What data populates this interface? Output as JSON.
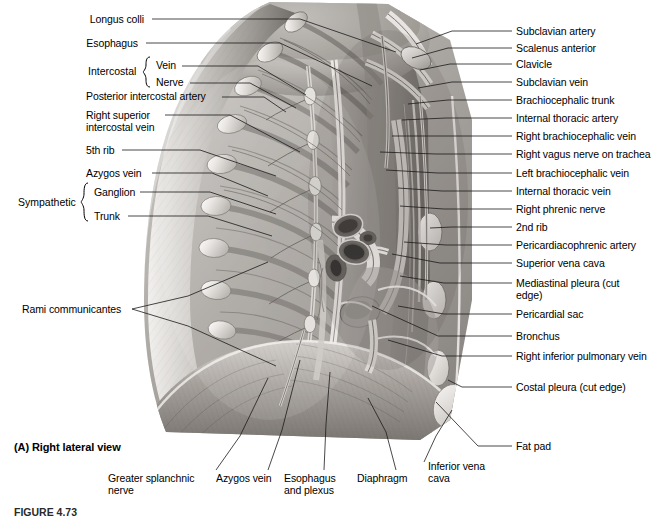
{
  "figure": {
    "view_caption": "(A) Right lateral view",
    "figure_number": "FIGURE 4.73",
    "illustration_alt": "Right lateral view of the thoracic cavity wall and mediastinum, grayscale anatomical drawing"
  },
  "labels_left": [
    {
      "id": "longus-colli",
      "text": "Longus colli",
      "x": 88,
      "y": 13
    },
    {
      "id": "esophagus",
      "text": "Esophagus",
      "x": 88,
      "y": 37
    },
    {
      "id": "intercostal-vein",
      "text": "Vein",
      "x": 152,
      "y": 62
    },
    {
      "id": "intercostal-nerve",
      "text": "Nerve",
      "x": 152,
      "y": 79
    },
    {
      "id": "posterior-intercostal-artery",
      "text": "Posterior intercostal artery",
      "x": 88,
      "y": 93
    },
    {
      "id": "right-superior-intercostal-vein",
      "text": "Right superior\nintercostal vein",
      "x": 88,
      "y": 111
    },
    {
      "id": "fifth-rib",
      "text": "5th rib",
      "x": 88,
      "y": 146
    },
    {
      "id": "azygos-vein",
      "text": "Azygos vein",
      "x": 88,
      "y": 169
    },
    {
      "id": "sympathetic-ganglion",
      "text": "Ganglion",
      "x": 90,
      "y": 188
    },
    {
      "id": "sympathetic-trunk",
      "text": "Trunk",
      "x": 90,
      "y": 212
    },
    {
      "id": "rami-communicantes",
      "text": "Rami communicantes",
      "x": 22,
      "y": 305
    }
  ],
  "brace_groups": [
    {
      "id": "intercostal",
      "text": "Intercostal",
      "x": 88,
      "y": 70
    },
    {
      "id": "sympathetic",
      "text": "Sympathetic",
      "x": 18,
      "y": 200
    }
  ],
  "labels_right": [
    {
      "id": "subclavian-artery",
      "text": "Subclavian artery",
      "x": 516,
      "y": 34
    },
    {
      "id": "scalenus-anterior",
      "text": "Scalenus anterior",
      "x": 516,
      "y": 51
    },
    {
      "id": "clavicle",
      "text": "Clavicle",
      "x": 516,
      "y": 67
    },
    {
      "id": "subclavian-vein",
      "text": "Subclavian vein",
      "x": 516,
      "y": 85
    },
    {
      "id": "brachiocephalic-trunk",
      "text": "Brachiocephalic trunk",
      "x": 516,
      "y": 103
    },
    {
      "id": "internal-thoracic-artery",
      "text": "Internal thoracic artery",
      "x": 516,
      "y": 121
    },
    {
      "id": "right-brachiocephalic-vein",
      "text": "Right brachiocephalic vein",
      "x": 516,
      "y": 139
    },
    {
      "id": "right-vagus-nerve-on-trachea",
      "text": "Right vagus nerve on trachea",
      "x": 516,
      "y": 157
    },
    {
      "id": "left-brachiocephalic-vein",
      "text": "Left brachiocephalic vein",
      "x": 516,
      "y": 176
    },
    {
      "id": "internal-thoracic-vein",
      "text": "Internal thoracic vein",
      "x": 516,
      "y": 194
    },
    {
      "id": "right-phrenic-nerve",
      "text": "Right phrenic nerve",
      "x": 516,
      "y": 212
    },
    {
      "id": "second-rib",
      "text": "2nd rib",
      "x": 516,
      "y": 230
    },
    {
      "id": "pericardiacophrenic-artery",
      "text": "Pericardiacophrenic artery",
      "x": 516,
      "y": 248
    },
    {
      "id": "superior-vena-cava",
      "text": "Superior vena cava",
      "x": 516,
      "y": 266
    },
    {
      "id": "mediastinal-pleura",
      "text": "Mediastinal pleura\n(cut edge)",
      "x": 516,
      "y": 286
    },
    {
      "id": "pericardial-sac",
      "text": "Pericardial sac",
      "x": 516,
      "y": 317
    },
    {
      "id": "bronchus",
      "text": "Bronchus",
      "x": 516,
      "y": 339
    },
    {
      "id": "right-inferior-pulmonary-vein",
      "text": "Right inferior pulmonary\nvein",
      "x": 516,
      "y": 359
    },
    {
      "id": "costal-pleura",
      "text": "Costal pleura (cut edge)",
      "x": 516,
      "y": 390
    },
    {
      "id": "fat-pad",
      "text": "Fat pad",
      "x": 516,
      "y": 449
    }
  ],
  "labels_bottom": [
    {
      "id": "greater-splanchnic-nerve",
      "text": "Greater splanchnic\nnerve",
      "x": 108,
      "y": 478
    },
    {
      "id": "azygos-vein-bottom",
      "text": "Azygos vein",
      "x": 216,
      "y": 478
    },
    {
      "id": "esophagus-and-plexus",
      "text": "Esophagus\nand plexus",
      "x": 284,
      "y": 478
    },
    {
      "id": "diaphragm",
      "text": "Diaphragm",
      "x": 357,
      "y": 478
    },
    {
      "id": "inferior-vena-cava",
      "text": "Inferior vena\ncava",
      "x": 428,
      "y": 466
    }
  ],
  "colors": {
    "text": "#000000",
    "leader_line": "#1a1a1a",
    "background": "#ffffff",
    "illustration_light": "#e8e6e3",
    "illustration_mid": "#9a9691",
    "illustration_dark": "#4a4743"
  }
}
